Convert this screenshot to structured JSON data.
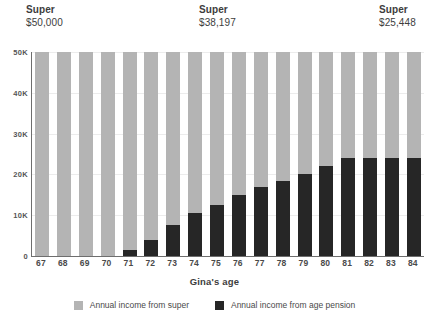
{
  "chart_data": {
    "type": "bar",
    "stacked": true,
    "title": "",
    "xlabel": "Gina's age",
    "ylabel": "",
    "categories": [
      "67",
      "68",
      "69",
      "70",
      "71",
      "72",
      "73",
      "74",
      "75",
      "76",
      "77",
      "78",
      "79",
      "80",
      "81",
      "82",
      "83",
      "84"
    ],
    "ylim": [
      0,
      50000
    ],
    "yticks": [
      0,
      10000,
      20000,
      30000,
      40000,
      50000
    ],
    "ytick_labels": [
      "0",
      "10K",
      "20K",
      "30K",
      "40K",
      "50K"
    ],
    "grid": true,
    "legend_position": "bottom",
    "series": [
      {
        "name": "Annual income from age pension",
        "color": "#262626",
        "values": [
          0,
          0,
          0,
          0,
          1500,
          4000,
          7500,
          10500,
          12500,
          15000,
          17000,
          18500,
          20000,
          22000,
          24000,
          24000,
          24000,
          24000
        ]
      },
      {
        "name": "Annual income from super",
        "color": "#b4b4b4",
        "values": [
          50000,
          50000,
          50000,
          50000,
          48500,
          46000,
          42500,
          39500,
          37500,
          35000,
          33000,
          31500,
          30000,
          28000,
          26000,
          26000,
          26000,
          26000
        ]
      }
    ],
    "totals": [
      50000,
      50000,
      50000,
      50000,
      50000,
      50000,
      50000,
      50000,
      50000,
      50000,
      50000,
      50000,
      50000,
      50000,
      50000,
      50000,
      50000,
      50000
    ],
    "annotations": [
      {
        "title": "Super",
        "value": "$50,000",
        "category": "67"
      },
      {
        "title": "Super",
        "value": "$38,197",
        "category": "75"
      },
      {
        "title": "Super",
        "value": "$25,448",
        "category": "84"
      }
    ]
  },
  "legend": {
    "items": [
      {
        "label": "Annual income from super",
        "color": "#b4b4b4"
      },
      {
        "label": "Annual income from age pension",
        "color": "#262626"
      }
    ]
  }
}
